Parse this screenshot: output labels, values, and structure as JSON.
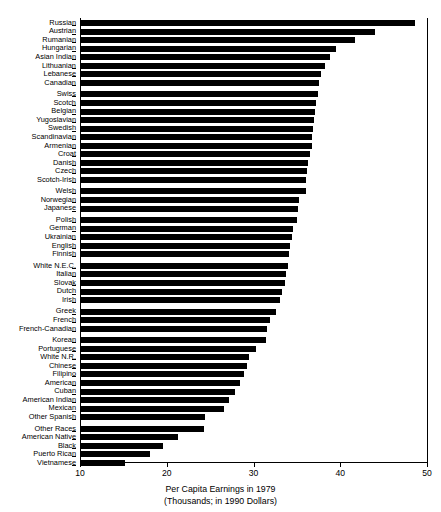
{
  "chart_data": {
    "type": "bar",
    "orientation": "horizontal",
    "title": "Per Capita Earnings in 1979",
    "subtitle": "(Thousands; in 1990 Dollars)",
    "xlabel": "Per Capita Earnings in 1979",
    "ylabel": "",
    "xlim": [
      10,
      50
    ],
    "xticks": [
      10,
      20,
      30,
      40,
      50
    ],
    "xtick_labels": [
      "10",
      "20",
      "30",
      "40",
      "50"
    ],
    "grid": false,
    "legend": null,
    "baseline": 10,
    "categories": [
      "Russian",
      "Austrian",
      "Rumanian",
      "Hungarian",
      "Asian Indian",
      "Lithuanian",
      "Lebanese",
      "Canadian",
      "Swiss",
      "Scotch",
      "Belgian",
      "Yugoslavian",
      "Swedish",
      "Scandinavian",
      "Armenian",
      "Croat",
      "Danish",
      "Czech",
      "Scotch-Irish",
      "Welsh",
      "Norwegian",
      "Japanese",
      "Polish",
      "German",
      "Ukrainian",
      "English",
      "Finnish",
      "White N.E.C.",
      "Italian",
      "Slovak",
      "Dutch",
      "Irish",
      "Greek",
      "French",
      "French-Canadian",
      "Korean",
      "Portuguese",
      "White N.R.",
      "Chinese",
      "Filipino",
      "American",
      "Cuban",
      "American Indian",
      "Mexican",
      "Other Spanish",
      "Other Races",
      "American Native",
      "Black",
      "Puerto Rican",
      "Vietnamese"
    ],
    "values": [
      48.6,
      44.0,
      41.7,
      39.5,
      38.8,
      38.2,
      37.8,
      37.5,
      37.4,
      37.2,
      37.1,
      37.0,
      36.9,
      36.8,
      36.7,
      36.5,
      36.3,
      36.2,
      36.1,
      36.0,
      35.3,
      35.1,
      35.0,
      34.6,
      34.4,
      34.2,
      34.1,
      34.0,
      33.7,
      33.6,
      33.3,
      33.1,
      32.6,
      31.9,
      31.6,
      31.4,
      30.3,
      29.5,
      29.2,
      28.9,
      28.5,
      27.9,
      27.2,
      26.6,
      24.4,
      24.3,
      21.3,
      19.6,
      18.1,
      15.2
    ],
    "group_breaks_after": [
      8,
      19,
      22,
      27,
      32,
      35,
      45
    ],
    "bar_color": "#000000",
    "background_color": "#ffffff",
    "n_categories": 50,
    "units": "thousands of 1990 dollars",
    "sorted": "descending"
  }
}
